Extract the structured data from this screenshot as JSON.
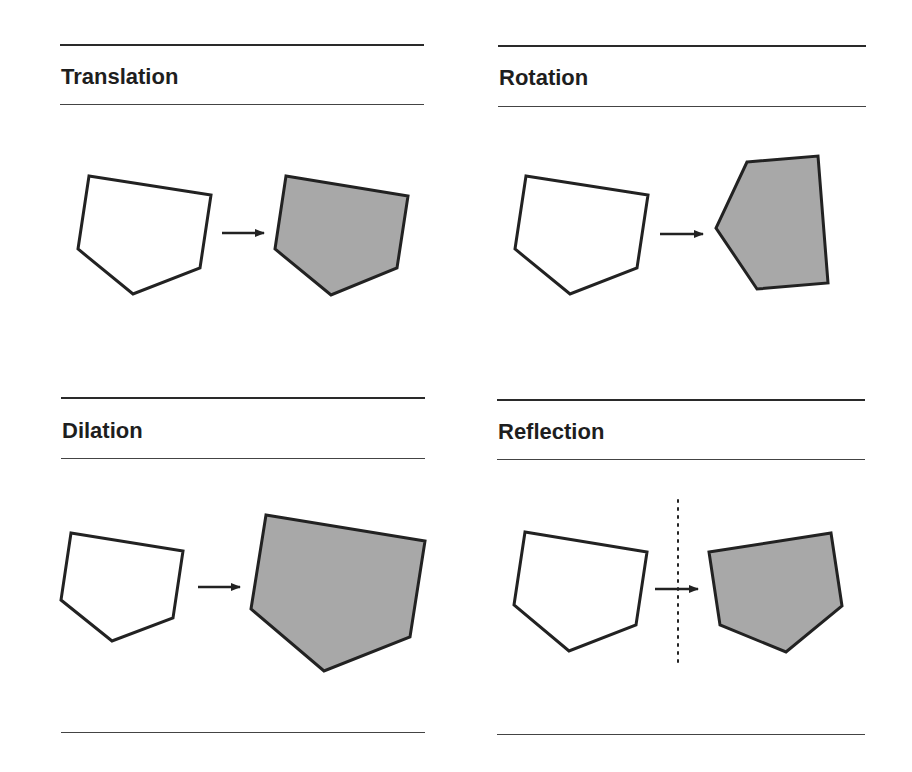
{
  "panels": [
    {
      "id": "translation",
      "title": "Translation"
    },
    {
      "id": "rotation",
      "title": "Rotation"
    },
    {
      "id": "dilation",
      "title": "Dilation"
    },
    {
      "id": "reflection",
      "title": "Reflection"
    }
  ],
  "colors": {
    "original_fill": "#ffffff",
    "image_fill": "#a8a8a8",
    "stroke": "#222222"
  }
}
